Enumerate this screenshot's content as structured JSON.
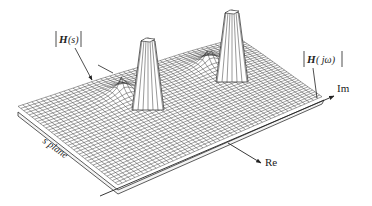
{
  "diagram": {
    "type": "3d-surface-plot",
    "labels": {
      "surface": "|H(s)|",
      "surface_name": "H",
      "surface_arg": "(s)",
      "freq_response": "|H(jω)|",
      "freq_name": "H",
      "freq_arg": "( jω)",
      "imag_axis": "Im",
      "real_axis": "Re",
      "plane": "s plane"
    },
    "peaks": [
      {
        "name": "left-pole-peak"
      },
      {
        "name": "right-pole-peak"
      }
    ],
    "colors": {
      "line": "#222222",
      "background": "#ffffff"
    }
  }
}
